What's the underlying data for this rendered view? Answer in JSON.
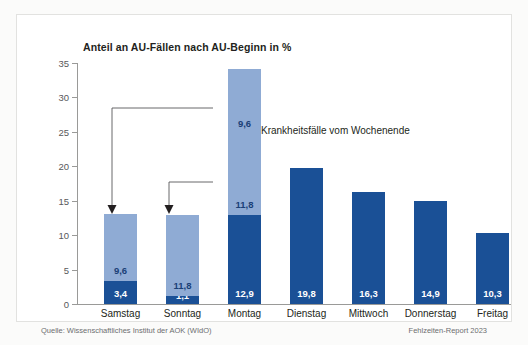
{
  "chart_data": {
    "type": "bar",
    "title": "Anteil an AU-Fällen nach AU-Beginn in %",
    "xlabel": "",
    "ylabel": "",
    "ylim": [
      0,
      35
    ],
    "yticks": [
      0,
      5,
      10,
      15,
      20,
      25,
      30,
      35
    ],
    "grid": false,
    "legend": "none",
    "stacked": true,
    "categories": [
      "Samstag",
      "Sonntag",
      "Montag",
      "Dienstag",
      "Mittwoch",
      "Donnerstag",
      "Freitag"
    ],
    "series": [
      {
        "name": "AU-Beginn am Tag",
        "color": "#1a5096",
        "values": [
          3.4,
          1.1,
          12.9,
          19.8,
          16.3,
          14.9,
          10.3
        ],
        "labels": [
          "3,4",
          "1,1",
          "12,9",
          "19,8",
          "16,3",
          "14,9",
          "10,3"
        ]
      },
      {
        "name": "Krankheitsfälle vom Wochenende (Sonntag)",
        "color": "#8fabd4",
        "values": [
          9.6,
          11.8,
          11.8,
          0,
          0,
          0,
          0
        ],
        "labels": [
          "9,6",
          "11,8",
          "11,8",
          "",
          "",
          "",
          ""
        ]
      },
      {
        "name": "Krankheitsfälle vom Wochenende (Samstag)",
        "color": "#8fabd4",
        "values": [
          0,
          0,
          9.6,
          0,
          0,
          0,
          0
        ],
        "labels": [
          "",
          "",
          "9,6",
          "",
          "",
          "",
          ""
        ]
      }
    ],
    "totals": [
      13.0,
      12.9,
      34.3,
      19.8,
      16.3,
      14.9,
      10.3
    ],
    "annotations": [
      {
        "text": "Krankheitsfälle vom Wochenende",
        "type": "brace-label",
        "refers_to": "Montag light segments"
      },
      {
        "text": "",
        "type": "arrow",
        "from": "Montag 9,6 segment",
        "to": "Samstag bar"
      },
      {
        "text": "",
        "type": "arrow",
        "from": "Montag 11,8 segment",
        "to": "Sonntag bar"
      }
    ]
  },
  "colors": {
    "dark_blue": "#1a5096",
    "light_blue": "#8fabd4",
    "axis": "#9a9a98",
    "text": "#231f20",
    "footer_text": "#6d6e70",
    "card_background": "#ffffff",
    "page_background": "#fbfbfa"
  },
  "footer": {
    "source": "Quelle: Wissenschaftliches Institut der AOK (WIdO)",
    "report": "Fehlzeiten-Report 2023"
  }
}
